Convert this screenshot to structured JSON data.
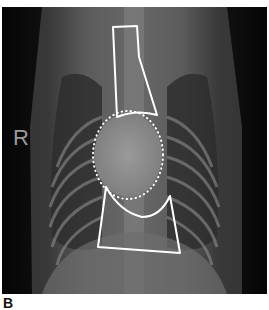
{
  "figure": {
    "panel_label": "B",
    "side_marker": "R",
    "annotations": [
      {
        "name": "cranial-mediastinum-outline",
        "style": "solid white line"
      },
      {
        "name": "cardiac-silhouette-outline",
        "style": "dotted white line"
      },
      {
        "name": "caudal-region-outline",
        "style": "solid white line"
      }
    ],
    "colors": {
      "background": "#ffffff",
      "outline": "#ffffff",
      "film_dark": "#050505",
      "film_soft_tissue": "#7a7a7a"
    }
  }
}
